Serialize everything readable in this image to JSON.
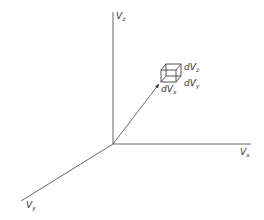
{
  "diagram": {
    "axes": {
      "vz": {
        "label": "V",
        "sub": "z"
      },
      "vx": {
        "label": "V",
        "sub": "x"
      },
      "vy": {
        "label": "V",
        "sub": "y"
      }
    },
    "element": {
      "dvz": {
        "label": "dV",
        "sub": "z"
      },
      "dvy": {
        "label": "dV",
        "sub": "y"
      },
      "dvx": {
        "label": "dV",
        "sub": "x"
      }
    },
    "colors": {
      "line": "#555555",
      "text": "#333333"
    }
  }
}
